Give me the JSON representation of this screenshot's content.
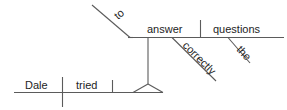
{
  "diagram": {
    "type": "reed-kellogg-sentence-diagram",
    "sentence": "Dale tried to answer the questions correctly.",
    "background_color": "#ffffff",
    "line_color": "#5b5b5b",
    "text_color": "#1d1d1d",
    "words": {
      "subject": "Dale",
      "main_verb": "tried",
      "infinitive_marker": "to",
      "infinitive_verb": "answer",
      "direct_object": "questions",
      "article": "the",
      "adverb": "correctly"
    },
    "labels": {
      "dale": "Dale",
      "tried": "tried",
      "to": "to",
      "answer": "answer",
      "questions": "questions",
      "the": "the",
      "correctly": "correctly"
    }
  }
}
